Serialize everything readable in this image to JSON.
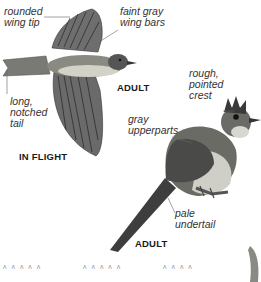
{
  "flight_bird": {
    "labels": {
      "rounded_wing_tip": "rounded\nwing tip",
      "faint_gray_wing_bars": "faint gray\nwing bars",
      "long_notched_tail": "long,\nnotched\ntail"
    },
    "caption_adult": "ADULT",
    "caption_in_flight": "IN FLIGHT"
  },
  "perched_bird": {
    "labels": {
      "rough_pointed_crest": "rough,\npointed\ncrest",
      "gray_upperparts": "gray\nupperparts",
      "pale_undertail": "pale\nundertail"
    },
    "caption_adult": "ADULT"
  },
  "grass_marks": [
    "ʌ ʌ ʌ ʌ ʌ",
    "ʌ ʌ ʌ ʌ ʌ",
    "ʌ ʌ ʌ ʌ"
  ],
  "colors": {
    "bird_dark": "#3a3a3a",
    "bird_mid": "#7a7a7a",
    "bird_light": "#d8d8d4",
    "leader_line": "#666666"
  }
}
